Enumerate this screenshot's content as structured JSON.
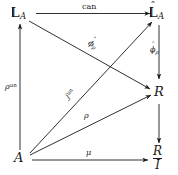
{
  "diagram": {
    "type": "commutative-diagram",
    "background_color": "#ffffff",
    "ink_color": "#1a1a1a",
    "nodes": [
      {
        "id": "L_A",
        "label": "L",
        "subscript": "A",
        "hat": false,
        "position": "top-left"
      },
      {
        "id": "Lhat_A",
        "label": "L",
        "subscript": "A",
        "hat": true,
        "position": "top-right"
      },
      {
        "id": "R",
        "label": "R",
        "subscript": "",
        "hat": false,
        "position": "middle-right"
      },
      {
        "id": "A",
        "label": "A",
        "subscript": "",
        "hat": false,
        "position": "bottom-left"
      },
      {
        "id": "R_over_I",
        "numerator": "R",
        "denominator": "I",
        "position": "bottom-right"
      }
    ],
    "edges": [
      {
        "id": "can",
        "from": "L_A",
        "to": "Lhat_A",
        "label": "can",
        "style": "upright"
      },
      {
        "id": "rho_un",
        "from": "A",
        "to": "L_A",
        "label": "ρ",
        "superscript": "un",
        "style": "italic"
      },
      {
        "id": "phi_rho",
        "from": "L_A",
        "to": "R",
        "label": "ϕ",
        "subscript": "ρ",
        "hat": true,
        "style": "italic"
      },
      {
        "id": "phihat_rho",
        "from": "Lhat_A",
        "to": "R",
        "label": "ϕ",
        "subscript": "ρ",
        "hat": true,
        "style": "italic"
      },
      {
        "id": "j_un",
        "from": "A",
        "to": "Lhat_A",
        "label": "j",
        "superscript": "un",
        "style": "italic"
      },
      {
        "id": "rho",
        "from": "A",
        "to": "R",
        "label": "ρ",
        "style": "italic"
      },
      {
        "id": "mu",
        "from": "A",
        "to": "R_over_I",
        "label": "μ",
        "style": "italic"
      },
      {
        "id": "quotient",
        "from": "R",
        "to": "R_over_I",
        "label": "",
        "style": "none"
      }
    ]
  },
  "labels": {
    "node_L_A": "L",
    "node_L_A_sub": "A",
    "node_Lhat_A": "L",
    "node_Lhat_A_sub": "A",
    "node_R": "R",
    "node_A": "A",
    "node_R_num": "R",
    "node_R_den": "I",
    "edge_can": "can",
    "edge_rho_un_base": "ρ",
    "edge_rho_un_sup": "un",
    "edge_phi_rho_base": "ϕ",
    "edge_phi_rho_sub": "ρ",
    "edge_phihat_rho_base": "ϕ",
    "edge_phihat_rho_sub": "ρ",
    "edge_j_un_base": "j",
    "edge_j_un_sup": "un",
    "edge_rho": "ρ",
    "edge_mu": "μ",
    "hat_glyph": "ˆ"
  }
}
